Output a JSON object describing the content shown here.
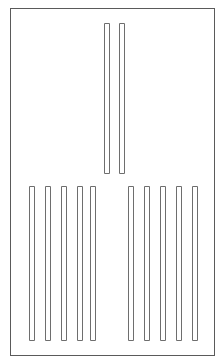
{
  "figure": {
    "width": 223,
    "height": 363,
    "background_color": "#ffffff"
  },
  "frame": {
    "label": "outer-frame",
    "x": 10,
    "y": 8,
    "width": 204,
    "height": 347,
    "stroke_color": "#5a5a5a",
    "fill_color": "#ffffff",
    "stroke_width": 1
  },
  "style": {
    "bar_stroke_color": "#6e6e6e",
    "bar_fill_color": "#ffffff",
    "bar_stroke_width": 1
  },
  "groups": [
    {
      "name": "top-center-group",
      "label": "Top center pair",
      "count": 2,
      "bar_width": 5,
      "bar_top": 23,
      "bar_bottom": 173,
      "bar_height": 150,
      "bars": [
        {
          "index": 1,
          "x": 104,
          "y": 23,
          "width": 5,
          "height": 150
        },
        {
          "index": 2,
          "x": 119,
          "y": 23,
          "width": 5,
          "height": 150
        }
      ]
    },
    {
      "name": "bottom-left-group",
      "label": "Bottom left group",
      "count": 5,
      "bar_width": 5,
      "bar_top": 186,
      "bar_bottom": 340,
      "bar_height": 154,
      "bars": [
        {
          "index": 1,
          "x": 29,
          "y": 186,
          "width": 5,
          "height": 154
        },
        {
          "index": 2,
          "x": 45,
          "y": 186,
          "width": 5,
          "height": 154
        },
        {
          "index": 3,
          "x": 61,
          "y": 186,
          "width": 5,
          "height": 154
        },
        {
          "index": 4,
          "x": 77,
          "y": 186,
          "width": 5,
          "height": 154
        },
        {
          "index": 5,
          "x": 90,
          "y": 186,
          "width": 5,
          "height": 154
        }
      ]
    },
    {
      "name": "bottom-right-group",
      "label": "Bottom right group",
      "count": 5,
      "bar_width": 5,
      "bar_top": 186,
      "bar_bottom": 340,
      "bar_height": 154,
      "bars": [
        {
          "index": 1,
          "x": 128,
          "y": 186,
          "width": 5,
          "height": 154
        },
        {
          "index": 2,
          "x": 144,
          "y": 186,
          "width": 5,
          "height": 154
        },
        {
          "index": 3,
          "x": 160,
          "y": 186,
          "width": 5,
          "height": 154
        },
        {
          "index": 4,
          "x": 176,
          "y": 186,
          "width": 5,
          "height": 154
        },
        {
          "index": 5,
          "x": 192,
          "y": 186,
          "width": 5,
          "height": 154
        }
      ]
    }
  ]
}
